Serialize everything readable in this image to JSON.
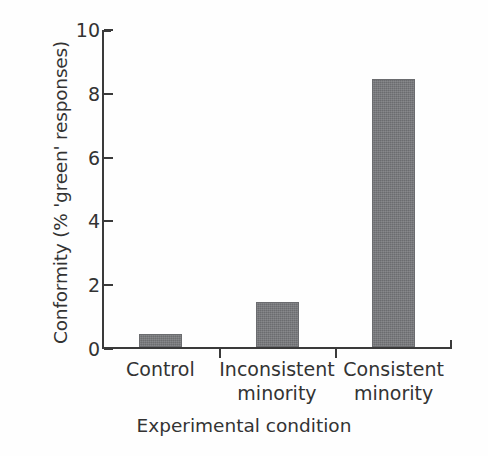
{
  "chart_data": {
    "type": "bar",
    "title": "",
    "xlabel": "Experimental condition",
    "ylabel": "Conformity (% 'green' responses)",
    "categories": [
      "Control",
      "Inconsistent minority",
      "Consistent minority"
    ],
    "category_lines": [
      [
        "Control",
        ""
      ],
      [
        "Inconsistent",
        "minority"
      ],
      [
        "Consistent",
        "minority"
      ]
    ],
    "values": [
      0.4,
      1.4,
      8.4
    ],
    "ylim": [
      0,
      10
    ],
    "yticks": [
      0,
      2,
      4,
      6,
      8,
      10
    ],
    "ytick_labels": [
      "0",
      "2",
      "4",
      "6",
      "8",
      "10"
    ],
    "grid": false,
    "legend": false,
    "bar_color": "#76777a",
    "axis_color": "#3a3a3a",
    "text_color": "#333333",
    "background": "#ffffff"
  }
}
